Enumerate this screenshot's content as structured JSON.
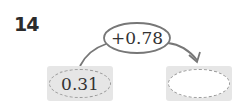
{
  "problem": {
    "number": "14",
    "start_value": "0.31",
    "operation": "+0.78",
    "result_value": ""
  },
  "colors": {
    "box_fill": "#e6e6e6",
    "dash": "#9a9a9a",
    "stroke": "#777777"
  }
}
